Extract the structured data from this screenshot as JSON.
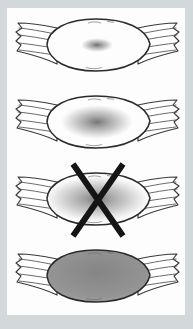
{
  "figure": {
    "background_color": "#d3d8db",
    "panel_color": "#fdfdfd",
    "outline_color": "#2b2b2b",
    "tendon_line_color": "#4f4f4f",
    "shade_color": "#5e5e5e",
    "cross_color": "#151515",
    "muscles": [
      {
        "id": "muscle-stage-1",
        "shading": "small-central-spot",
        "crossed_out": false,
        "shade": {
          "rx": 16,
          "ry": 7,
          "opacity": 0.95
        }
      },
      {
        "id": "muscle-stage-2",
        "shading": "medium-central-blur",
        "crossed_out": false,
        "shade": {
          "rx": 36,
          "ry": 17,
          "opacity": 0.9
        }
      },
      {
        "id": "muscle-stage-3",
        "shading": "large-diffuse-blur",
        "crossed_out": true,
        "shade": {
          "rx": 52,
          "ry": 23,
          "opacity": 0.85
        }
      },
      {
        "id": "muscle-stage-4",
        "shading": "full-gray",
        "crossed_out": false,
        "shade": {
          "rx": 0,
          "ry": 0,
          "opacity": 0
        },
        "belly_fill": "gray-gradient"
      }
    ]
  }
}
